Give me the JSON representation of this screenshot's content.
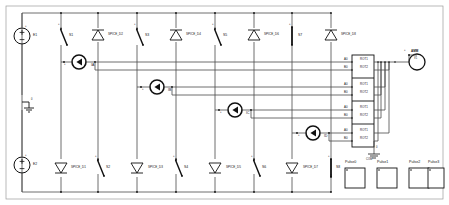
{
  "diagram": {
    "type": "circuit-schematic",
    "background_color": "#ffffff",
    "wire_color": "#3a3a3a",
    "device_color": "#111111"
  },
  "sources": [
    {
      "name": "E1",
      "label": "E1",
      "kind": "voltage-source",
      "polarity_top": "+",
      "polarity_bottom": "-"
    },
    {
      "name": "E2",
      "label": "E2",
      "kind": "voltage-source",
      "polarity_top": "+",
      "polarity_bottom": "-"
    }
  ],
  "ground": {
    "label": "0",
    "kind": "ground"
  },
  "top_branch": {
    "switches": [
      {
        "label": "S1"
      },
      {
        "label": "S3"
      },
      {
        "label": "S5"
      },
      {
        "label": "S7"
      }
    ],
    "diodes": [
      {
        "label": "SPICE_D2"
      },
      {
        "label": "SPICE_D4"
      },
      {
        "label": "SPICE_D6"
      },
      {
        "label": "SPICE_D8"
      }
    ]
  },
  "bottom_branch": {
    "diodes": [
      {
        "label": "SPICE_D1"
      },
      {
        "label": "SPICE_D3"
      },
      {
        "label": "SPICE_D5"
      },
      {
        "label": "SPICE_D7"
      }
    ],
    "switches": [
      {
        "label": "S2"
      },
      {
        "label": "S4"
      },
      {
        "label": "S6"
      },
      {
        "label": "S8"
      }
    ]
  },
  "current_sources": [
    {
      "label": "IA",
      "terminal": "+"
    },
    {
      "label": "IB",
      "terminal": "+"
    },
    {
      "label": "IC",
      "terminal": "+"
    },
    {
      "label": "ID",
      "terminal": "+"
    }
  ],
  "blocks": [
    {
      "inputs": [
        "A0",
        "B0"
      ],
      "outputs": [
        "ROT1",
        "ROT2"
      ]
    },
    {
      "inputs": [
        "A0",
        "B0"
      ],
      "outputs": [
        "ROT1",
        "ROT2"
      ]
    },
    {
      "inputs": [
        "A0",
        "B0"
      ],
      "outputs": [
        "ROT1",
        "ROT2"
      ]
    },
    {
      "inputs": [
        "A0",
        "B0"
      ],
      "outputs": [
        "ROT1",
        "ROT2"
      ]
    }
  ],
  "block_bottom_terminal": {
    "label": "0",
    "node": "COM"
  },
  "meter": {
    "label": "AMM",
    "sub": "V1",
    "plus": "+"
  },
  "pulse_generators": [
    {
      "label": "Pulse0"
    },
    {
      "label": "Pulse1"
    },
    {
      "label": "Pulse2"
    },
    {
      "label": "Pulse3"
    }
  ]
}
